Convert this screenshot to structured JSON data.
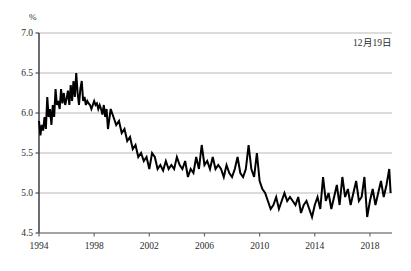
{
  "chart_data": {
    "type": "line",
    "title": "",
    "subtitle": "",
    "xlabel": "",
    "ylabel": "%",
    "unit_label": "%",
    "annotation": "12月19日",
    "annotations": [
      "12月19日"
    ],
    "grid": true,
    "grid_axis": "y",
    "legend": null,
    "legend_position": "none",
    "xlim": [
      1994.0,
      2019.6
    ],
    "ylim": [
      4.5,
      7.0
    ],
    "ytick_values": [
      4.5,
      5.0,
      5.5,
      6.0,
      6.5,
      7.0
    ],
    "ytick_labels": [
      "4.5",
      "5.0",
      "5.5",
      "6.0",
      "6.5",
      "7.0"
    ],
    "xtick_values": [
      1994,
      1998,
      2002,
      2006,
      2010,
      2014,
      2018
    ],
    "xtick_labels": [
      "1994",
      "1998",
      "2002",
      "2006",
      "2010",
      "2014",
      "2018"
    ],
    "line_color": "#000000",
    "line_width": 2.0,
    "grid_color": "#b9b9b9",
    "axis_color": "#555555",
    "background_color": "#ffffff",
    "series": [
      {
        "name": "rate",
        "x": [
          1994.0,
          1994.1,
          1994.2,
          1994.3,
          1994.4,
          1994.5,
          1994.6,
          1994.7,
          1994.8,
          1994.9,
          1995.0,
          1995.1,
          1995.2,
          1995.3,
          1995.4,
          1995.5,
          1995.6,
          1995.7,
          1995.8,
          1995.9,
          1996.0,
          1996.1,
          1996.2,
          1996.3,
          1996.4,
          1996.5,
          1996.6,
          1996.7,
          1996.8,
          1996.9,
          1997.0,
          1997.1,
          1997.2,
          1997.3,
          1997.4,
          1997.5,
          1997.6,
          1997.7,
          1997.8,
          1997.9,
          1998.0,
          1998.1,
          1998.2,
          1998.3,
          1998.4,
          1998.5,
          1998.6,
          1998.7,
          1998.8,
          1998.9,
          1999.0,
          1999.2,
          1999.4,
          1999.6,
          1999.8,
          2000.0,
          2000.2,
          2000.4,
          2000.6,
          2000.8,
          2001.0,
          2001.2,
          2001.4,
          2001.6,
          2001.8,
          2002.0,
          2002.2,
          2002.4,
          2002.6,
          2002.8,
          2003.0,
          2003.2,
          2003.4,
          2003.6,
          2003.8,
          2004.0,
          2004.2,
          2004.4,
          2004.6,
          2004.8,
          2005.0,
          2005.2,
          2005.4,
          2005.6,
          2005.8,
          2006.0,
          2006.2,
          2006.4,
          2006.6,
          2006.8,
          2007.0,
          2007.2,
          2007.4,
          2007.6,
          2007.8,
          2008.0,
          2008.2,
          2008.4,
          2008.6,
          2008.8,
          2009.0,
          2009.2,
          2009.4,
          2009.6,
          2009.8,
          2010.0,
          2010.2,
          2010.4,
          2010.6,
          2010.8,
          2011.0,
          2011.2,
          2011.4,
          2011.6,
          2011.8,
          2012.0,
          2012.2,
          2012.4,
          2012.6,
          2012.8,
          2013.0,
          2013.2,
          2013.4,
          2013.6,
          2013.8,
          2014.0,
          2014.2,
          2014.4,
          2014.6,
          2014.8,
          2015.0,
          2015.2,
          2015.4,
          2015.6,
          2015.8,
          2016.0,
          2016.2,
          2016.4,
          2016.6,
          2016.8,
          2017.0,
          2017.2,
          2017.4,
          2017.6,
          2017.8,
          2018.0,
          2018.2,
          2018.4,
          2018.6,
          2018.8,
          2019.0,
          2019.2,
          2019.4,
          2019.5
        ],
        "values": [
          5.9,
          5.72,
          5.85,
          5.78,
          5.95,
          5.8,
          6.2,
          5.95,
          6.05,
          5.85,
          6.1,
          5.95,
          6.3,
          6.1,
          6.15,
          6.05,
          6.3,
          6.12,
          6.25,
          6.1,
          6.18,
          6.28,
          6.1,
          6.35,
          6.15,
          6.4,
          6.2,
          6.5,
          6.25,
          6.1,
          6.3,
          6.4,
          6.15,
          6.2,
          6.1,
          6.15,
          6.12,
          6.1,
          6.05,
          6.1,
          6.15,
          6.1,
          6.12,
          6.05,
          6.1,
          6.05,
          5.98,
          6.1,
          5.95,
          6.05,
          5.8,
          6.05,
          5.95,
          5.85,
          5.9,
          5.75,
          5.8,
          5.65,
          5.7,
          5.55,
          5.6,
          5.45,
          5.5,
          5.4,
          5.45,
          5.3,
          5.5,
          5.45,
          5.3,
          5.35,
          5.28,
          5.4,
          5.3,
          5.35,
          5.3,
          5.45,
          5.35,
          5.3,
          5.4,
          5.2,
          5.3,
          5.25,
          5.45,
          5.3,
          5.6,
          5.35,
          5.4,
          5.3,
          5.45,
          5.3,
          5.35,
          5.3,
          5.2,
          5.35,
          5.25,
          5.2,
          5.3,
          5.45,
          5.25,
          5.2,
          5.3,
          5.6,
          5.3,
          5.2,
          5.5,
          5.15,
          5.05,
          5.0,
          4.9,
          4.8,
          4.85,
          4.95,
          4.8,
          4.9,
          5.0,
          4.9,
          4.95,
          4.9,
          4.85,
          4.95,
          4.75,
          4.85,
          4.9,
          4.8,
          4.7,
          4.85,
          4.95,
          4.8,
          5.2,
          4.9,
          5.0,
          4.8,
          4.95,
          5.1,
          4.85,
          5.2,
          4.95,
          5.05,
          4.85,
          5.0,
          5.15,
          4.9,
          4.95,
          5.2,
          4.7,
          4.9,
          5.05,
          4.85,
          5.0,
          5.15,
          4.95,
          5.1,
          5.3,
          5.0
        ]
      }
    ]
  },
  "chart": {
    "unit_label": "%",
    "annotation": "12月19日"
  },
  "geometry": {
    "plot_left": 39,
    "plot_right": 392,
    "plot_top": 33,
    "plot_bottom": 233
  }
}
